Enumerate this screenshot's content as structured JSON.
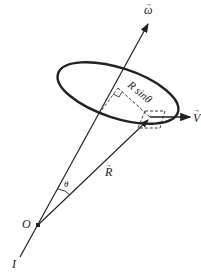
{
  "figure": {
    "labels": {
      "omega": "ω",
      "velocity": "V",
      "radius_vector": "R",
      "angle": "θ",
      "origin": "O",
      "axis": "I",
      "perpendicular_distance": "R sinθ"
    },
    "colors": {
      "stroke": "#222222",
      "background": "#ffffff"
    }
  }
}
